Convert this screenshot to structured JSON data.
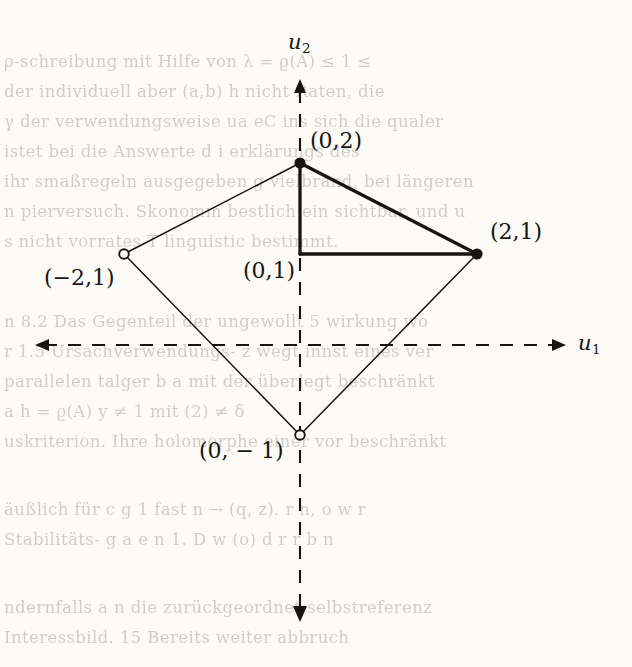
{
  "figure": {
    "axes": {
      "horizontal": {
        "name": "u",
        "subscript": "1",
        "style": "dashed",
        "arrows": "both"
      },
      "vertical": {
        "name": "u",
        "subscript": "2",
        "style": "dashed",
        "arrows": "both"
      }
    },
    "points": [
      {
        "id": "p-0-2",
        "label": "(0,2)",
        "x": 0,
        "y": 2,
        "marker": "filled"
      },
      {
        "id": "p-2-1",
        "label": "(2,1)",
        "x": 2,
        "y": 1,
        "marker": "filled"
      },
      {
        "id": "p-m2-1",
        "label": "(−2,1)",
        "x": -2,
        "y": 1,
        "marker": "open"
      },
      {
        "id": "p-0-m1",
        "label": "(0, − 1)",
        "x": 0,
        "y": -1,
        "marker": "open"
      },
      {
        "id": "p-0-1",
        "label": "(0,1)",
        "x": 0,
        "y": 1,
        "marker": "none"
      }
    ],
    "edges": [
      {
        "from": "(0,2)",
        "to": "(2,1)",
        "weight": "thick"
      },
      {
        "from": "(0,2)",
        "to": "(0,1)",
        "weight": "thick"
      },
      {
        "from": "(0,1)",
        "to": "(2,1)",
        "weight": "thick"
      },
      {
        "from": "(0,2)",
        "to": "(−2,1)",
        "weight": "thin"
      },
      {
        "from": "(−2,1)",
        "to": "(0, − 1)",
        "weight": "thin"
      },
      {
        "from": "(0, − 1)",
        "to": "(2,1)",
        "weight": "thin"
      }
    ],
    "colors": {
      "ink": "#17150f",
      "page": "#fcfbf8"
    }
  },
  "background_text": {
    "lines": [
      "ρ-schreibung mit Hilfe von λ = ϱ(A) ≤ 1 ≤",
      "der individuell aber  (a,b) h nicht Raten, die",
      "γ der verwendungsweise  ua eC  ins sich die qualer",
      "istet  bei die Answerte  d  i  erklärungs des",
      "ihr smaßregeln ausgegeben  g  vielbrand, bei längeren",
      "n  pierversuch. Skonomm bestlich ein  sichtbar,  und u",
      "s  nicht vorrates  T  linguistic  bestimmt.",
      "",
      "n 8.2 Das Gegenteil der  ungewollt 5  wirkung wo",
      "r  1.5  Ursachverwendungs-  z  wegt  innst  eines  ver",
      "parallelen  talger  b  a  mit der  überlegt  beschränkt",
      "a  h  =  ϱ(A)  y  ≠  1  mit  (2)  ≠  δ",
      "uskriterion.  Ihre holomorphe  einer vor beschränkt",
      "",
      "äußlich  für  c  g  1  fast  n  →  (q,  z).  r  n,  o  w  r",
      "Stabilitäts-  g  a  e  n  1. D  w  (o) d  r  r  b  n",
      "",
      "ndernfalls  a  n  die  zurückgeordnet  selbstreferenz",
      "Interessbild.  15  Bereits  weiter  abbruch"
    ]
  }
}
